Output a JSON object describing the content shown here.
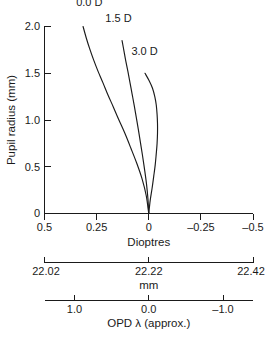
{
  "chart_data": {
    "type": "line",
    "title": "",
    "subtitle": "",
    "ylabel": "Pupil radius (mm)",
    "ylim": [
      0,
      2.0
    ],
    "yticks": [
      0,
      0.5,
      1.0,
      1.5,
      2.0
    ],
    "ytick_labels": [
      "0",
      "0.5",
      "1.0",
      "1.5",
      "2.0"
    ],
    "grid": false,
    "legend_position": "inline-curve-labels",
    "axes": [
      {
        "id": "dioptres",
        "xlabel": "Dioptres",
        "xlim": [
          0.5,
          -0.5
        ],
        "reversed": true,
        "xticks": [
          0.5,
          0.25,
          0,
          -0.25,
          -0.5
        ],
        "xtick_labels": [
          "0.5",
          "0.25",
          "0",
          "–0.25",
          "–0.5"
        ]
      },
      {
        "id": "mm",
        "xlabel": "mm",
        "xlim": [
          22.02,
          22.42
        ],
        "reversed": false,
        "xticks": [
          22.02,
          22.22,
          22.42
        ],
        "xtick_labels": [
          "22.02",
          "22.22",
          "22.42"
        ]
      },
      {
        "id": "opd",
        "xlabel": "OPD λ (approx.)",
        "xlim": [
          1.4,
          -1.4
        ],
        "reversed": true,
        "xticks": [
          1.0,
          0.0,
          -1.0
        ],
        "xtick_labels": [
          "1.0",
          "0.0",
          "–1.0"
        ]
      }
    ],
    "series": [
      {
        "name": "0.0 D",
        "label": "0.0 D",
        "label_x": 0.285,
        "label_y": 2.22,
        "color": "#1a1a1a",
        "x": [
          0.315,
          0.3,
          0.283,
          0.264,
          0.243,
          0.22,
          0.196,
          0.17,
          0.143,
          0.115,
          0.086,
          0.058,
          0.032,
          0.012,
          0.0
        ],
        "y": [
          2.0,
          1.88,
          1.76,
          1.64,
          1.52,
          1.4,
          1.27,
          1.14,
          1.0,
          0.86,
          0.7,
          0.54,
          0.37,
          0.19,
          0.0
        ]
      },
      {
        "name": "1.5 D",
        "label": "1.5 D",
        "label_x": 0.145,
        "label_y": 2.05,
        "color": "#1a1a1a",
        "x": [
          0.128,
          0.119,
          0.11,
          0.1,
          0.09,
          0.08,
          0.07,
          0.06,
          0.05,
          0.04,
          0.03,
          0.02,
          0.011,
          0.004,
          0.0
        ],
        "y": [
          1.85,
          1.74,
          1.63,
          1.52,
          1.4,
          1.28,
          1.16,
          1.03,
          0.9,
          0.76,
          0.62,
          0.47,
          0.32,
          0.16,
          0.0
        ]
      },
      {
        "name": "3.0 D",
        "label": "3.0 D",
        "label_x": 0.02,
        "label_y": 1.7,
        "color": "#1a1a1a",
        "x": [
          0.018,
          -0.002,
          -0.018,
          -0.029,
          -0.036,
          -0.04,
          -0.042,
          -0.042,
          -0.04,
          -0.036,
          -0.031,
          -0.024,
          -0.016,
          -0.007,
          0.0
        ],
        "y": [
          1.5,
          1.42,
          1.34,
          1.25,
          1.16,
          1.06,
          0.96,
          0.86,
          0.75,
          0.64,
          0.52,
          0.4,
          0.27,
          0.14,
          0.0
        ]
      }
    ]
  }
}
